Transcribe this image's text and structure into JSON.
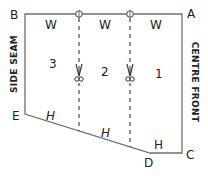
{
  "diagram": {
    "type": "pattern-piece",
    "corners": {
      "A": {
        "label": "A",
        "x": 182,
        "y": 14
      },
      "B": {
        "label": "B",
        "x": 25,
        "y": 14
      },
      "C": {
        "label": "C",
        "x": 182,
        "y": 153
      },
      "D": {
        "label": "D",
        "x": 150,
        "y": 153
      },
      "E": {
        "label": "E",
        "x": 25,
        "y": 114
      }
    },
    "side_labels": {
      "left": "SIDE SEAM",
      "right": "CENTRE FRONT"
    },
    "top_labels": [
      "W",
      "W",
      "W"
    ],
    "section_numbers": [
      "3",
      "2",
      "1"
    ],
    "hem_labels": [
      "H",
      "H",
      "H"
    ],
    "cut_lines": [
      {
        "x": 79,
        "marker": "scissors-icon"
      },
      {
        "x": 130,
        "marker": "scissors-icon"
      }
    ],
    "colors": {
      "outline": "#6f6f6f",
      "text": "#222222"
    }
  }
}
